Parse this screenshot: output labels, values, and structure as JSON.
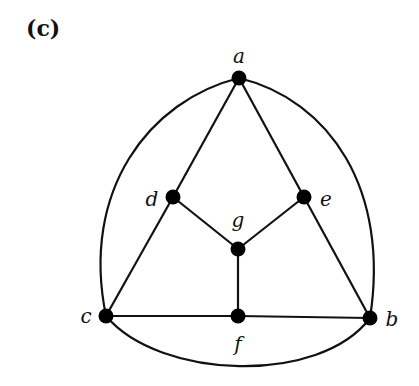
{
  "panel_label": "(c)",
  "graph": {
    "nodes": [
      {
        "id": "a",
        "label": "a",
        "x": 239,
        "y": 78,
        "lx": 239,
        "ly": 63,
        "anchor": "middle"
      },
      {
        "id": "b",
        "label": "b",
        "x": 370,
        "y": 318,
        "lx": 392,
        "ly": 326,
        "anchor": "middle"
      },
      {
        "id": "c",
        "label": "c",
        "x": 106,
        "y": 316,
        "lx": 86,
        "ly": 323,
        "anchor": "middle"
      },
      {
        "id": "d",
        "label": "d",
        "x": 173,
        "y": 197,
        "lx": 152,
        "ly": 206,
        "anchor": "middle"
      },
      {
        "id": "e",
        "label": "e",
        "x": 304,
        "y": 197,
        "lx": 326,
        "ly": 206,
        "anchor": "middle"
      },
      {
        "id": "f",
        "label": "f",
        "x": 238,
        "y": 316,
        "lx": 238,
        "ly": 351,
        "anchor": "middle"
      },
      {
        "id": "g",
        "label": "g",
        "x": 238,
        "y": 249,
        "lx": 238,
        "ly": 227,
        "anchor": "middle"
      }
    ],
    "edges": [
      {
        "from": "a",
        "to": "d",
        "type": "line"
      },
      {
        "from": "a",
        "to": "e",
        "type": "line"
      },
      {
        "from": "d",
        "to": "c",
        "type": "line"
      },
      {
        "from": "e",
        "to": "b",
        "type": "line"
      },
      {
        "from": "d",
        "to": "g",
        "type": "line"
      },
      {
        "from": "e",
        "to": "g",
        "type": "line"
      },
      {
        "from": "g",
        "to": "f",
        "type": "line"
      },
      {
        "from": "c",
        "to": "f",
        "type": "line"
      },
      {
        "from": "f",
        "to": "b",
        "type": "line"
      },
      {
        "from": "a",
        "to": "c",
        "type": "arc",
        "path": "M239,78 C150,100 80,190 106,316"
      },
      {
        "from": "a",
        "to": "b",
        "type": "arc",
        "path": "M239,78 C330,100 390,190 370,318"
      },
      {
        "from": "c",
        "to": "b",
        "type": "arc",
        "path": "M106,316 C160,380 320,385 370,318"
      }
    ]
  }
}
